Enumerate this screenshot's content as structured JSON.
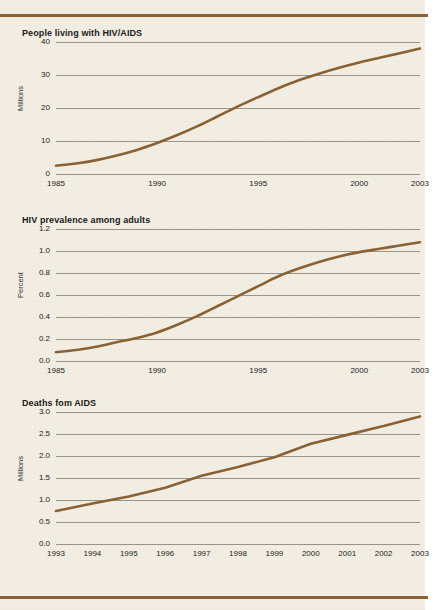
{
  "figure": {
    "background_color": "#f3eee3",
    "rule_color": "#8a6134",
    "line_color": "#8a6134",
    "grid_color": "#9a9488"
  },
  "charts": [
    {
      "title": "People living with HIV/AIDS",
      "ylabel": "Millions",
      "yticks": [
        "0",
        "10",
        "20",
        "30",
        "40"
      ],
      "xticks": [
        "1985",
        "1990",
        "1995",
        "2000",
        "2003"
      ]
    },
    {
      "title": "HIV prevalence among adults",
      "ylabel": "Percent",
      "yticks": [
        "0.0",
        "0.2",
        "0.4",
        "0.6",
        "0.8",
        "1.0",
        "1.2"
      ],
      "xticks": [
        "1985",
        "1990",
        "1995",
        "2000",
        "2003"
      ]
    },
    {
      "title": "Deaths fom AIDS",
      "ylabel": "Millions",
      "yticks": [
        "0.0",
        "0.5",
        "1.0",
        "1.5",
        "2.0",
        "2.5",
        "3.0"
      ],
      "xticks": [
        "1993",
        "1994",
        "1995",
        "1996",
        "1997",
        "1998",
        "1999",
        "2000",
        "2001",
        "2002",
        "2003"
      ]
    }
  ],
  "chart_data": [
    {
      "type": "line",
      "title": "People living with HIV/AIDS",
      "xlabel": "",
      "ylabel": "Millions",
      "ylim": [
        0,
        40
      ],
      "xlim": [
        1985,
        2003
      ],
      "ytick_values": [
        0,
        10,
        20,
        30,
        40
      ],
      "xtick_values": [
        1985,
        1990,
        1995,
        2000,
        2003
      ],
      "grid": true,
      "legend": "none",
      "x": [
        1985,
        1986,
        1987,
        1988,
        1989,
        1990,
        1991,
        1992,
        1993,
        1994,
        1995,
        1996,
        1997,
        1998,
        1999,
        2000,
        2001,
        2002,
        2003
      ],
      "values": [
        2.5,
        3.2,
        4.2,
        5.6,
        7.3,
        9.4,
        11.8,
        14.5,
        17.5,
        20.5,
        23.3,
        26.0,
        28.4,
        30.4,
        32.2,
        33.8,
        35.2,
        36.6,
        38.0
      ]
    },
    {
      "type": "line",
      "title": "HIV prevalence among adults",
      "xlabel": "",
      "ylabel": "Percent",
      "ylim": [
        0.0,
        1.2
      ],
      "xlim": [
        1985,
        2003
      ],
      "ytick_values": [
        0.0,
        0.2,
        0.4,
        0.6,
        0.8,
        1.0,
        1.2
      ],
      "xtick_values": [
        1985,
        1990,
        1995,
        2000,
        2003
      ],
      "grid": true,
      "legend": "none",
      "x": [
        1985,
        1986,
        1987,
        1988,
        1989,
        1990,
        1991,
        1992,
        1993,
        1994,
        1995,
        1996,
        1997,
        1998,
        1999,
        2000,
        2001,
        2002,
        2003
      ],
      "values": [
        0.08,
        0.1,
        0.13,
        0.17,
        0.21,
        0.26,
        0.33,
        0.41,
        0.5,
        0.59,
        0.68,
        0.77,
        0.84,
        0.9,
        0.95,
        0.99,
        1.02,
        1.05,
        1.08
      ]
    },
    {
      "type": "line",
      "title": "Deaths fom AIDS",
      "xlabel": "",
      "ylabel": "Millions",
      "ylim": [
        0.0,
        3.0
      ],
      "xlim": [
        1993,
        2003
      ],
      "ytick_values": [
        0.0,
        0.5,
        1.0,
        1.5,
        2.0,
        2.5,
        3.0
      ],
      "xtick_values": [
        1993,
        1994,
        1995,
        1996,
        1997,
        1998,
        1999,
        2000,
        2001,
        2002,
        2003
      ],
      "grid": true,
      "legend": "none",
      "x": [
        1993,
        1994,
        1995,
        1996,
        1997,
        1998,
        1999,
        2000,
        2001,
        2002,
        2003
      ],
      "values": [
        0.75,
        0.92,
        1.08,
        1.28,
        1.55,
        1.75,
        1.97,
        2.28,
        2.48,
        2.68,
        2.9
      ]
    }
  ]
}
